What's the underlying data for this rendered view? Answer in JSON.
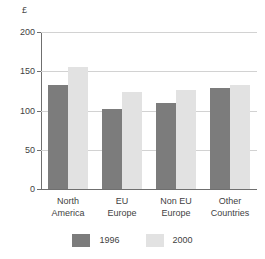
{
  "chart_data": {
    "type": "bar",
    "title": "",
    "subtitle": "",
    "unit_label": "£",
    "xlabel": "",
    "ylabel": "",
    "ylim": [
      0,
      200
    ],
    "ytick_values": [
      0,
      50,
      100,
      150,
      200
    ],
    "ytick_labels": [
      "0",
      "50",
      "100",
      "150",
      "200"
    ],
    "grid": true,
    "legend_position": "bottom",
    "categories": [
      "North America",
      "EU Europe",
      "Non EU Europe",
      "Other Countries"
    ],
    "category_lines": [
      [
        "North",
        "America"
      ],
      [
        "EU",
        "Europe"
      ],
      [
        "Non EU",
        "Europe"
      ],
      [
        "Other",
        "Countries"
      ]
    ],
    "series": [
      {
        "name": "1996",
        "color": "#7c7c7c",
        "values": [
          132,
          102,
          109,
          129
        ]
      },
      {
        "name": "2000",
        "color": "#e2e2e2",
        "values": [
          155,
          123,
          126,
          132
        ]
      }
    ]
  },
  "legend": {
    "items": [
      {
        "label": "1996"
      },
      {
        "label": "2000"
      }
    ]
  }
}
